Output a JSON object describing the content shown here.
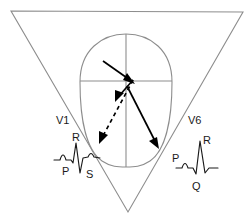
{
  "figure": {
    "background_color": "#ffffff",
    "outline_color": "#8d8d8d",
    "vector_color": "#000000",
    "text_color": "#1a1a1a"
  },
  "torso": {
    "name": "inverted-triangle-torso",
    "vertices": [
      [
        11,
        11
      ],
      [
        243,
        12
      ],
      [
        128,
        212
      ]
    ]
  },
  "heart": {
    "name": "heart-oval",
    "center": [
      126,
      100
    ],
    "left_edge": 79,
    "right_edge": 172,
    "top_edge": 34,
    "bottom_edge": 167,
    "axis_horizontal_y": 81,
    "axis_vertical_x": 126
  },
  "vectors": [
    {
      "id": "septal-vector",
      "style": "solid",
      "from": [
        104,
        62
      ],
      "to": [
        133,
        83
      ],
      "description": "short solid arrow pointing down-right into center"
    },
    {
      "id": "right-ventricle-vector",
      "style": "dashed",
      "from": [
        133,
        83
      ],
      "to": [
        100,
        142
      ],
      "description": "dashed arrow pointing down-left toward V1"
    },
    {
      "id": "left-ventricle-vector",
      "style": "solid",
      "from": [
        128,
        88
      ],
      "to": [
        158,
        148
      ],
      "description": "long solid arrow pointing down-right toward V6"
    },
    {
      "id": "mid-septal-arrowhead",
      "style": "solid-head-only",
      "at": [
        117,
        99
      ],
      "description": "arrowhead on dashed path near center"
    }
  ],
  "leads": [
    {
      "id": "v1",
      "label": "V1",
      "label_position": [
        56,
        124
      ],
      "waveform": {
        "name": "v1-ecg-trace",
        "complex": "rS",
        "deflections": [
          {
            "label": "R",
            "label_position": [
              76,
              143
            ],
            "polarity": "positive",
            "amplitude": "small"
          },
          {
            "label": "P",
            "label_position": [
              68,
              172
            ],
            "polarity": "positive",
            "amplitude": "small"
          },
          {
            "label": "S",
            "label_position": [
              91,
              175
            ],
            "polarity": "negative",
            "amplitude": "deep"
          }
        ]
      }
    },
    {
      "id": "v6",
      "label": "V6",
      "label_position": [
        188,
        124
      ],
      "waveform": {
        "name": "v6-ecg-trace",
        "complex": "qR",
        "deflections": [
          {
            "label": "P",
            "label_position": [
              178,
              158
            ],
            "polarity": "positive",
            "amplitude": "small"
          },
          {
            "label": "R",
            "label_position": [
              208,
              144
            ],
            "polarity": "positive",
            "amplitude": "tall"
          },
          {
            "label": "Q",
            "label_position": [
              196,
              187
            ],
            "polarity": "negative",
            "amplitude": "small"
          }
        ]
      }
    }
  ]
}
